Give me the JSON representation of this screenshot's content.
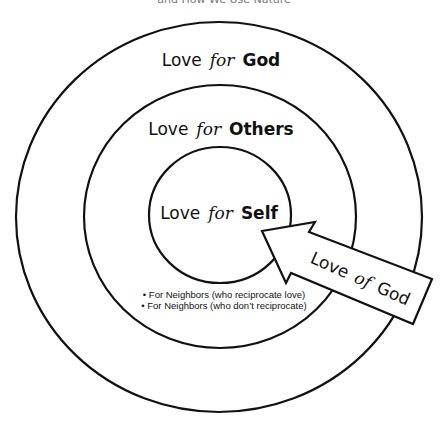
{
  "caption_partial": "and How We Use Nature",
  "rings": {
    "outer": {
      "prefix": "Love",
      "connector": "for",
      "object": "God"
    },
    "middle": {
      "prefix": "Love",
      "connector": "for",
      "object": "Others"
    },
    "inner": {
      "prefix": "Love",
      "connector": "for",
      "object": "Self"
    }
  },
  "neighbors": [
    "• For Neighbors (who reciprocate love)",
    "• For Neighbors (who don’t reciprocate)"
  ],
  "arrow": {
    "prefix": "Love",
    "connector": "of",
    "object": "God"
  },
  "colors": {
    "stroke": "#111111",
    "background": "#ffffff"
  }
}
